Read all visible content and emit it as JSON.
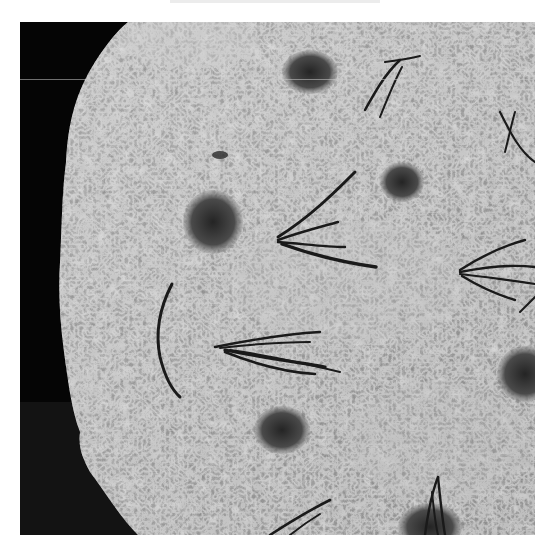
{
  "image": {
    "subject": "focaccia bread with rosemary sprigs and dimples",
    "tone": "grayscale",
    "colors": {
      "background": "#060606",
      "bread_base": "#9a9a9a",
      "bread_highlight": "#c8c8c8",
      "dimple": "#3a3a3a",
      "rosemary": "#1c1c1c",
      "page": "#ffffff"
    },
    "dimples": [
      {
        "cx": 290,
        "cy": 50,
        "rx": 24,
        "ry": 18
      },
      {
        "cx": 193,
        "cy": 200,
        "rx": 24,
        "ry": 26
      },
      {
        "cx": 382,
        "cy": 160,
        "rx": 18,
        "ry": 16
      },
      {
        "cx": 262,
        "cy": 408,
        "rx": 24,
        "ry": 20
      },
      {
        "cx": 498,
        "cy": 352,
        "rx": 22,
        "ry": 22
      },
      {
        "cx": 410,
        "cy": 500,
        "rx": 26,
        "ry": 20
      }
    ],
    "rosemary_sprigs": [
      {
        "location": "top-right"
      },
      {
        "location": "upper-right edge"
      },
      {
        "location": "center-upper"
      },
      {
        "location": "right-middle"
      },
      {
        "location": "center"
      },
      {
        "location": "left curved leaf"
      },
      {
        "location": "bottom-center"
      },
      {
        "location": "bottom-right"
      }
    ]
  }
}
